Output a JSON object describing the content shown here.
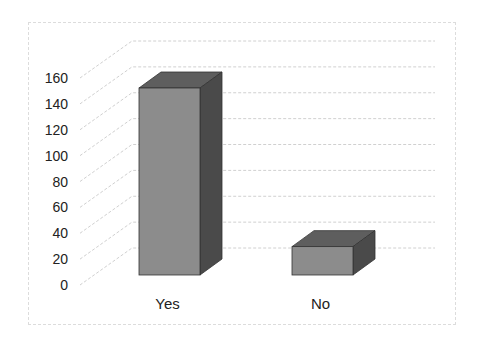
{
  "chart_data": {
    "type": "bar",
    "style": "3d-column",
    "title": "",
    "xlabel": "",
    "ylabel": "",
    "categories": [
      "Yes",
      "No"
    ],
    "values": [
      145,
      22
    ],
    "ylim": [
      0,
      160
    ],
    "yticks": [
      0,
      20,
      40,
      60,
      80,
      100,
      120,
      140,
      160
    ],
    "grid": true,
    "legend": null,
    "colors": {
      "front": "#8c8c8c",
      "top": "#5e5e5e",
      "side": "#4a4a4a",
      "grid": "#d0d0d0"
    }
  }
}
